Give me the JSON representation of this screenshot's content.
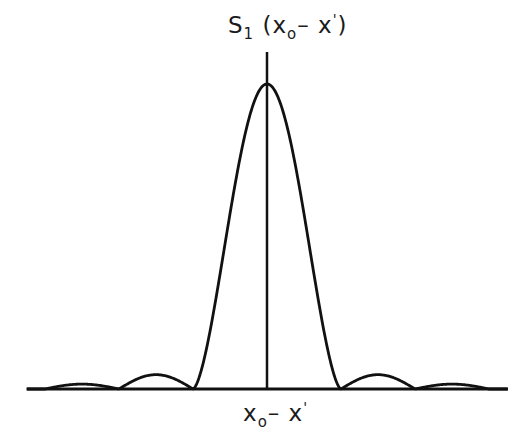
{
  "figure": {
    "y_label": {
      "main": "S",
      "sub": "1",
      "open": " (x",
      "sub2": "o",
      "mid": "– x",
      "sup": "'",
      "close": ")"
    },
    "x_label": {
      "main": "x",
      "sub": "o",
      "mid": "– x",
      "sup": "'"
    },
    "stroke_color": "#111111",
    "background": "#ffffff"
  },
  "chart_data": {
    "type": "line",
    "title": "",
    "xlabel": "x₀ – x'",
    "ylabel": "S₁(x₀ – x')",
    "grid": false,
    "legend": null,
    "x": [
      -3.3,
      -3,
      -2.5,
      -2,
      -1.5,
      -1,
      -0.5,
      0,
      0.5,
      1,
      1.5,
      2,
      2.5,
      3,
      3.3
    ],
    "values": [
      0.0,
      0.0,
      0.016,
      0.0,
      0.047,
      0.0,
      0.405,
      1.0,
      0.405,
      0.0,
      0.047,
      0.0,
      0.016,
      0.0,
      0.0
    ],
    "xlim": [
      -3.6,
      3.6
    ],
    "ylim": [
      0,
      1.05
    ],
    "side_lobes": {
      "first": {
        "relative_height": 0.047,
        "center_x": [
          -1.5,
          1.5
        ]
      },
      "second": {
        "relative_height": 0.016,
        "center_x": [
          -2.5,
          2.5
        ]
      }
    },
    "zeros": [
      -3,
      -2,
      -1,
      1,
      2,
      3
    ]
  }
}
